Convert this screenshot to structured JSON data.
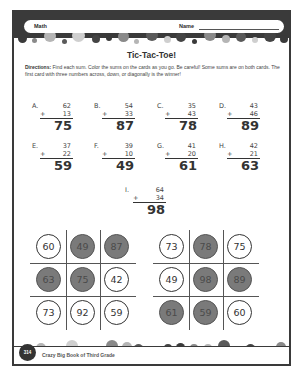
{
  "header": {
    "subject": "Math",
    "name_label": "Name"
  },
  "title": "Tic-Tac-Toe!",
  "directions": {
    "label": "Directions:",
    "text": " Find each sum. Color the sums on the cards as you go. Be careful! Some sums are on both cards. The first card with three numbers across, down, or diagonally is the winner!"
  },
  "problems": [
    {
      "label": "A.",
      "a": "62",
      "op": "+",
      "b": "13",
      "answer": "75"
    },
    {
      "label": "B.",
      "a": "54",
      "op": "+",
      "b": "33",
      "answer": "87"
    },
    {
      "label": "C.",
      "a": "35",
      "op": "+",
      "b": "43",
      "answer": "78"
    },
    {
      "label": "D.",
      "a": "43",
      "op": "+",
      "b": "46",
      "answer": "89"
    },
    {
      "label": "E.",
      "a": "37",
      "op": "+",
      "b": "22",
      "answer": "59"
    },
    {
      "label": "F.",
      "a": "39",
      "op": "+",
      "b": "10",
      "answer": "49"
    },
    {
      "label": "G.",
      "a": "41",
      "op": "+",
      "b": "20",
      "answer": "61"
    },
    {
      "label": "H.",
      "a": "42",
      "op": "+",
      "b": "21",
      "answer": "63"
    },
    {
      "label": "I.",
      "a": "64",
      "op": "+",
      "b": "34",
      "answer": "98"
    }
  ],
  "cards": [
    {
      "cells": [
        {
          "value": "60",
          "shaded": false
        },
        {
          "value": "49",
          "shaded": true
        },
        {
          "value": "87",
          "shaded": true
        },
        {
          "value": "63",
          "shaded": true
        },
        {
          "value": "75",
          "shaded": true
        },
        {
          "value": "42",
          "shaded": false
        },
        {
          "value": "73",
          "shaded": false
        },
        {
          "value": "92",
          "shaded": false
        },
        {
          "value": "59",
          "shaded": false
        }
      ]
    },
    {
      "cells": [
        {
          "value": "73",
          "shaded": false
        },
        {
          "value": "78",
          "shaded": true
        },
        {
          "value": "75",
          "shaded": false
        },
        {
          "value": "49",
          "shaded": false
        },
        {
          "value": "98",
          "shaded": true
        },
        {
          "value": "89",
          "shaded": true
        },
        {
          "value": "61",
          "shaded": true
        },
        {
          "value": "59",
          "shaded": true
        },
        {
          "value": "60",
          "shaded": false
        }
      ]
    }
  ],
  "footer": {
    "page_number": "314",
    "book_title": "Crazy Big Book of Third Grade"
  },
  "colors": {
    "frame": "#3a3a3a",
    "shaded_cell": "#7a7a7a"
  }
}
